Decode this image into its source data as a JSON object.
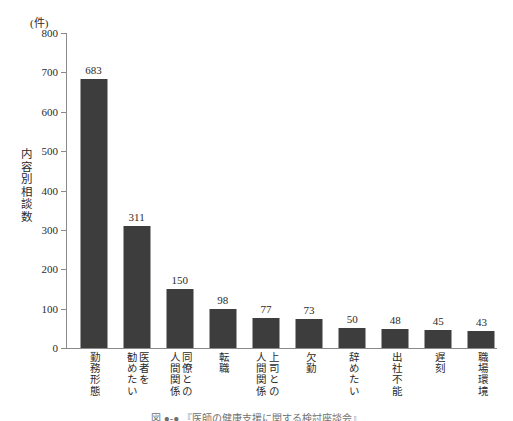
{
  "chart_data": {
    "type": "bar",
    "title": "",
    "unit_label": "(件)",
    "ylabel": "内容別相談数",
    "xlabel": "",
    "ylim": [
      0,
      800
    ],
    "ytick_step": 100,
    "yticks": [
      800,
      700,
      600,
      500,
      400,
      300,
      200,
      100,
      0
    ],
    "grid": false,
    "legend": null,
    "bar_color": "#3d3d3d",
    "axis_color": "#8a8a8a",
    "text_color": "#2b2b2b",
    "categories": [
      "勤務形態",
      "医者を\n勧めたい",
      "同僚との\n人間関係",
      "転職",
      "上司との\n人間関係",
      "欠勤",
      "辞めたい",
      "出社不能",
      "遅刻",
      "職場環境"
    ],
    "values": [
      683,
      311,
      150,
      98,
      77,
      73,
      50,
      48,
      45,
      43
    ],
    "value_labels": [
      "683",
      "311",
      "150",
      "98",
      "77",
      "73",
      "50",
      "48",
      "45",
      "43"
    ]
  },
  "caption": "図 ●-● 『医師の健康支援に関する検討座談会』"
}
